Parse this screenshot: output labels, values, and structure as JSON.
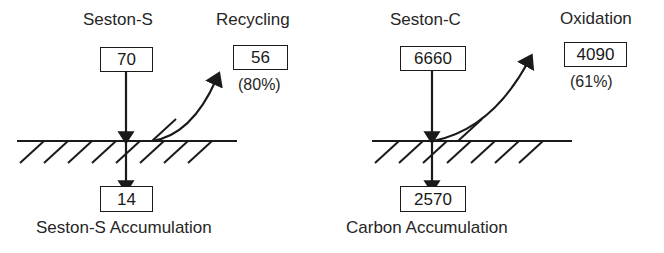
{
  "figure": {
    "background_color": "#ffffff",
    "line_color": "#1a1a1a"
  },
  "panels": [
    {
      "id": "sulfur",
      "source": {
        "label": "Seston-S",
        "value": "70"
      },
      "flux": {
        "label": "Recycling",
        "value": "56",
        "percent": "(80%)"
      },
      "sink": {
        "value": "14",
        "caption": "Seston-S Accumulation"
      }
    },
    {
      "id": "carbon",
      "source": {
        "label": "Seston-C",
        "value": "6660"
      },
      "flux": {
        "label": "Oxidation",
        "value": "4090",
        "percent": "(61%)"
      },
      "sink": {
        "value": "2570",
        "caption": "Carbon Accumulation"
      }
    }
  ]
}
